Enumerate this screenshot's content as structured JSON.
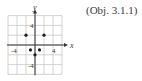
{
  "caption": "(Obj. 3.1.1)",
  "chart_data": {
    "type": "scatter",
    "title": "",
    "xlabel": "x",
    "ylabel": "y",
    "xlim": [
      -6,
      6
    ],
    "ylim": [
      -6,
      6
    ],
    "grid": true,
    "grid_step": 2,
    "x_tick_labels": [
      {
        "value": -4,
        "label": "-4"
      },
      {
        "value": 4,
        "label": "4"
      }
    ],
    "y_tick_labels": [
      {
        "value": 4,
        "label": "4"
      },
      {
        "value": -4,
        "label": "-4"
      }
    ],
    "points": [
      {
        "x": -2,
        "y": 2
      },
      {
        "x": 2,
        "y": 2
      },
      {
        "x": -1,
        "y": -1
      },
      {
        "x": 1,
        "y": -1
      },
      {
        "x": 0,
        "y": -2
      }
    ],
    "colors": {
      "grid": "#c8c8c8",
      "axis": "#333333",
      "point": "#1a1a1a"
    }
  }
}
